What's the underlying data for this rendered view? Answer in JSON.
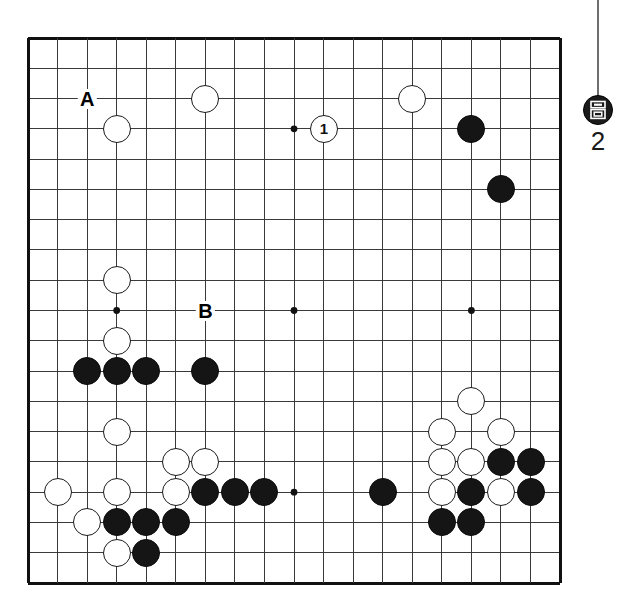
{
  "diagram": {
    "kind": "go-board-diagram",
    "board_size": 19,
    "background_color": "#ffffff",
    "line_color": "#3a3a3a",
    "border_color": "#111111",
    "black_color": "#151515",
    "white_color": "#ffffff",
    "geometry": {
      "left": 28,
      "top": 38,
      "right": 560,
      "bottom": 583,
      "col_step": 29.56,
      "row_step": 30.28,
      "stone_diameter": 28,
      "border_width": 3.0,
      "line_width": 1.0,
      "star_radius": 3.4
    },
    "star_points": [
      {
        "col": 4,
        "row": 4
      },
      {
        "col": 10,
        "row": 4
      },
      {
        "col": 16,
        "row": 4
      },
      {
        "col": 4,
        "row": 10
      },
      {
        "col": 10,
        "row": 10
      },
      {
        "col": 16,
        "row": 10
      },
      {
        "col": 4,
        "row": 16
      },
      {
        "col": 10,
        "row": 16
      },
      {
        "col": 16,
        "row": 16
      }
    ],
    "stones": [
      {
        "color": "white",
        "col": 7,
        "row": 3,
        "label": ""
      },
      {
        "color": "white",
        "col": 4,
        "row": 4,
        "label": ""
      },
      {
        "color": "white",
        "col": 11,
        "row": 4,
        "label": "1"
      },
      {
        "color": "white",
        "col": 14,
        "row": 3,
        "label": ""
      },
      {
        "color": "black",
        "col": 16,
        "row": 4,
        "label": ""
      },
      {
        "color": "black",
        "col": 17,
        "row": 6,
        "label": ""
      },
      {
        "color": "white",
        "col": 4,
        "row": 9,
        "label": ""
      },
      {
        "color": "white",
        "col": 4,
        "row": 11,
        "label": ""
      },
      {
        "color": "black",
        "col": 3,
        "row": 12,
        "label": ""
      },
      {
        "color": "black",
        "col": 4,
        "row": 12,
        "label": ""
      },
      {
        "color": "black",
        "col": 5,
        "row": 12,
        "label": ""
      },
      {
        "color": "black",
        "col": 7,
        "row": 12,
        "label": ""
      },
      {
        "color": "white",
        "col": 4,
        "row": 14,
        "label": ""
      },
      {
        "color": "white",
        "col": 6,
        "row": 15,
        "label": ""
      },
      {
        "color": "white",
        "col": 7,
        "row": 15,
        "label": ""
      },
      {
        "color": "white",
        "col": 2,
        "row": 16,
        "label": ""
      },
      {
        "color": "white",
        "col": 4,
        "row": 16,
        "label": ""
      },
      {
        "color": "white",
        "col": 6,
        "row": 16,
        "label": ""
      },
      {
        "color": "black",
        "col": 7,
        "row": 16,
        "label": ""
      },
      {
        "color": "black",
        "col": 8,
        "row": 16,
        "label": ""
      },
      {
        "color": "black",
        "col": 9,
        "row": 16,
        "label": ""
      },
      {
        "color": "white",
        "col": 3,
        "row": 17,
        "label": ""
      },
      {
        "color": "black",
        "col": 4,
        "row": 17,
        "label": ""
      },
      {
        "color": "black",
        "col": 5,
        "row": 17,
        "label": ""
      },
      {
        "color": "black",
        "col": 6,
        "row": 17,
        "label": ""
      },
      {
        "color": "white",
        "col": 4,
        "row": 18,
        "label": ""
      },
      {
        "color": "black",
        "col": 5,
        "row": 18,
        "label": ""
      },
      {
        "color": "black",
        "col": 13,
        "row": 16,
        "label": ""
      },
      {
        "color": "white",
        "col": 16,
        "row": 13,
        "label": ""
      },
      {
        "color": "white",
        "col": 15,
        "row": 14,
        "label": ""
      },
      {
        "color": "white",
        "col": 17,
        "row": 14,
        "label": ""
      },
      {
        "color": "white",
        "col": 15,
        "row": 15,
        "label": ""
      },
      {
        "color": "white",
        "col": 16,
        "row": 15,
        "label": ""
      },
      {
        "color": "black",
        "col": 17,
        "row": 15,
        "label": ""
      },
      {
        "color": "black",
        "col": 18,
        "row": 15,
        "label": ""
      },
      {
        "color": "white",
        "col": 15,
        "row": 16,
        "label": ""
      },
      {
        "color": "black",
        "col": 16,
        "row": 16,
        "label": ""
      },
      {
        "color": "white",
        "col": 17,
        "row": 16,
        "label": ""
      },
      {
        "color": "black",
        "col": 18,
        "row": 16,
        "label": ""
      },
      {
        "color": "black",
        "col": 15,
        "row": 17,
        "label": ""
      },
      {
        "color": "black",
        "col": 16,
        "row": 17,
        "label": ""
      }
    ],
    "point_labels": [
      {
        "text": "A",
        "col": 3,
        "row": 3
      },
      {
        "text": "B",
        "col": 7,
        "row": 10
      }
    ],
    "side_marker": {
      "number": "2",
      "stone_color": "black",
      "glyph_name": "captured-stone-mark",
      "tail_color": "#6e6e6e",
      "tail_top": 0,
      "tail_height": 96,
      "stone_center_x": 598,
      "stone_center_y": 110,
      "stone_diameter": 30,
      "number_y": 128
    }
  }
}
